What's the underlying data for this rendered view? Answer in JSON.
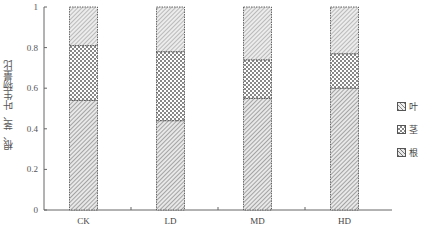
{
  "chart_data": {
    "type": "bar",
    "stacked": true,
    "title": "",
    "xlabel": "",
    "ylabel": "根、茎、叶生物量比",
    "ylim": [
      0,
      1
    ],
    "yticks": [
      "0",
      "0.2",
      "0.4",
      "0.6",
      "0.8",
      "1"
    ],
    "categories": [
      "CK",
      "LD",
      "MD",
      "HD"
    ],
    "series": [
      {
        "name": "根",
        "pattern": "diagonal-hatch",
        "values": [
          0.54,
          0.44,
          0.55,
          0.6
        ]
      },
      {
        "name": "茎",
        "pattern": "checkered",
        "values": [
          0.27,
          0.34,
          0.19,
          0.17
        ]
      },
      {
        "name": "叶",
        "pattern": "diagonal-hatch-light",
        "values": [
          0.19,
          0.22,
          0.26,
          0.23
        ]
      }
    ],
    "legend": {
      "position": "right",
      "items": [
        "叶",
        "茎",
        "根"
      ]
    },
    "grid": false
  }
}
